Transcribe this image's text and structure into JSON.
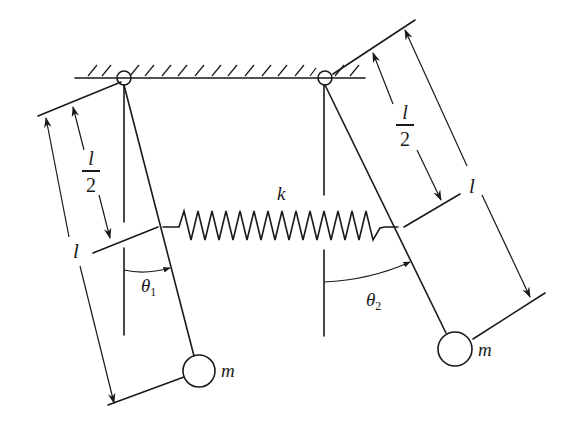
{
  "diagram": {
    "labels": {
      "spring_constant": "k",
      "mass_left": "m",
      "mass_right": "m",
      "length_left": "l",
      "length_right": "l",
      "half_length_left_num": "l",
      "half_length_left_den": "2",
      "half_length_right_num": "l",
      "half_length_right_den": "2",
      "theta1_symbol": "θ",
      "theta1_sub": "1",
      "theta2_symbol": "θ",
      "theta2_sub": "2"
    },
    "colors": {
      "stroke": "#1a1a1a",
      "background": "#ffffff"
    }
  }
}
